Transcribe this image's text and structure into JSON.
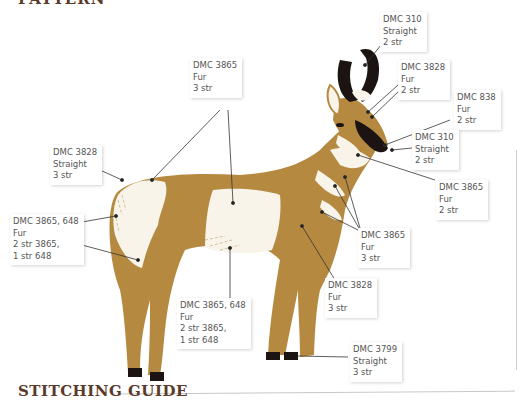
{
  "header": {
    "partial_title": "PATTERN"
  },
  "footer": {
    "title": "STITCHING GUIDE"
  },
  "colors": {
    "body": "#b5893f",
    "white": "#f8f4ea",
    "dark": "#1c1412",
    "title": "#5a3a2a"
  },
  "labels": [
    {
      "id": "horn",
      "lines": [
        "DMC 310",
        "Straight",
        "2 str"
      ]
    },
    {
      "id": "ear",
      "lines": [
        "DMC 3828",
        "Fur",
        "2 str"
      ]
    },
    {
      "id": "muzzle",
      "lines": [
        "DMC 838",
        "Fur",
        "2 str"
      ]
    },
    {
      "id": "nose",
      "lines": [
        "DMC 310",
        "Straight",
        "2 str"
      ]
    },
    {
      "id": "throat",
      "lines": [
        "DMC 3865",
        "Fur",
        "2 str"
      ]
    },
    {
      "id": "back",
      "lines": [
        "DMC 3865",
        "Fur",
        "3 str"
      ]
    },
    {
      "id": "rump-outline",
      "lines": [
        "DMC 3828",
        "Straight",
        "3 str"
      ]
    },
    {
      "id": "rump-fur",
      "lines": [
        "DMC 3865, 648",
        "Fur",
        "2 str 3865,",
        "1 str 648"
      ]
    },
    {
      "id": "neck-bands",
      "lines": [
        "DMC 3865",
        "Fur",
        "3 str"
      ]
    },
    {
      "id": "chest",
      "lines": [
        "DMC 3828",
        "Fur",
        "3 str"
      ]
    },
    {
      "id": "belly",
      "lines": [
        "DMC 3865, 648",
        "Fur",
        "2 str 3865,",
        "1 str 648"
      ]
    },
    {
      "id": "hooves",
      "lines": [
        "DMC 3799",
        "Straight",
        "3 str"
      ]
    }
  ]
}
